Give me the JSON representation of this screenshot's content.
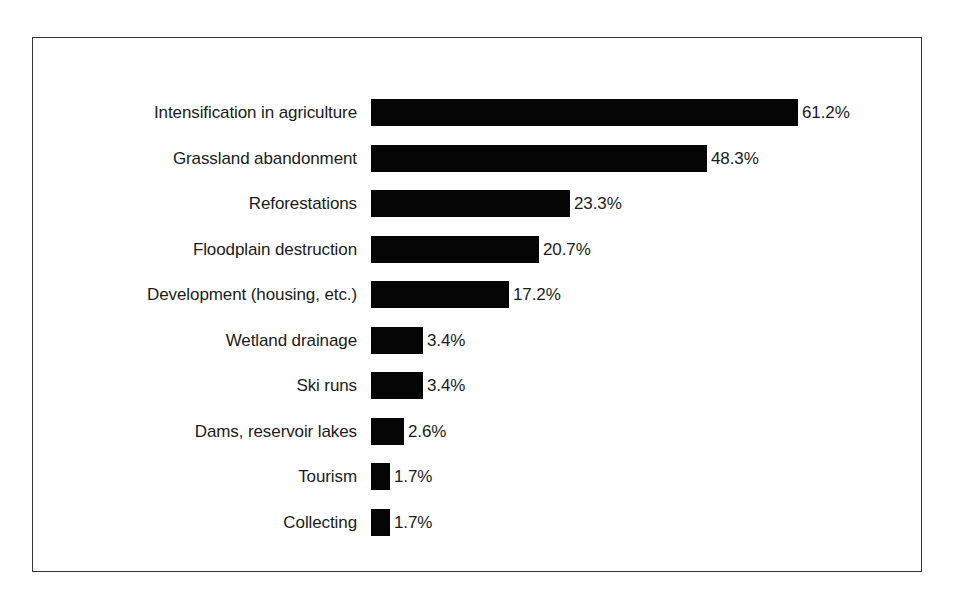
{
  "figure": {
    "background_color": "#ffffff",
    "border_color": "#343434",
    "bar_color": "#050505",
    "text_color": "#1b1b1b"
  },
  "chart_data": {
    "type": "bar",
    "orientation": "horizontal",
    "title": "",
    "subtitle": "",
    "xlabel": "",
    "ylabel": "",
    "grid": false,
    "legend": false,
    "axis_visible": false,
    "tick_labels_x": [],
    "value_label_suffix": "%",
    "xlim": [
      0,
      61.2
    ],
    "categories": [
      "Intensification in agriculture",
      "Grassland abandonment",
      "Reforestations",
      "Floodplain destruction",
      "Development (housing, etc.)",
      "Wetland drainage",
      "Ski runs",
      "Dams, reservoir lakes",
      "Tourism",
      "Collecting"
    ],
    "values": [
      61.2,
      48.3,
      23.3,
      20.7,
      17.2,
      3.4,
      3.4,
      2.6,
      1.7,
      1.7
    ],
    "value_labels": [
      "61.2%",
      "48.3%",
      "23.3%",
      "20.7%",
      "17.2%",
      "3.4%",
      "3.4%",
      "2.6%",
      "1.7%",
      "1.7%"
    ],
    "bar_pixel_widths": [
      427,
      336,
      199,
      168,
      138,
      52,
      52,
      33,
      19,
      19
    ]
  }
}
